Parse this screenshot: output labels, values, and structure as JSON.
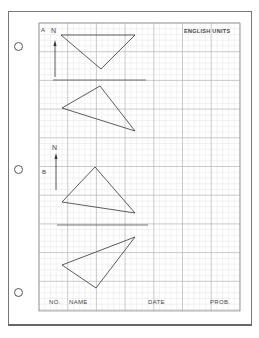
{
  "worksheet": {
    "header": {
      "units_label": "ENGLISH UNITS"
    },
    "sections": [
      {
        "label": "A",
        "north_label": "N"
      },
      {
        "label": "B",
        "north_label": "N"
      }
    ],
    "title_block": {
      "no_label": "NO.",
      "name_label": "NAME",
      "date_label": "DATE",
      "prob_label": "PROB."
    },
    "colors": {
      "grid_major": "#b8b8b8",
      "grid_minor": "#e2e2e2",
      "ink": "#333333"
    }
  }
}
